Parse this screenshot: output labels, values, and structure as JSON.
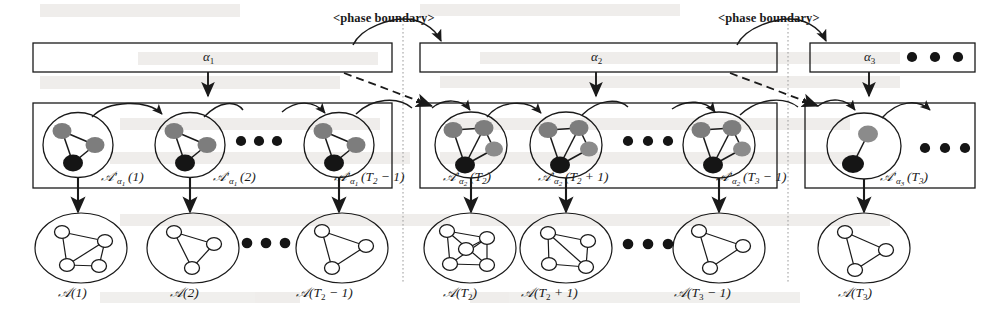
{
  "figure": {
    "type": "diagram",
    "background": "#ffffff",
    "ink": "#1a1a1a",
    "node_gray": "#7d7d7d",
    "node_black": "#151515",
    "node_hollow": "#ffffff",
    "dotted_guide_color": "#9a9a9a"
  },
  "annotations": {
    "phase_boundary_1": "<phase boundary>",
    "phase_boundary_2": "<phase boundary>"
  },
  "phase_row": {
    "boxes": [
      {
        "id": "alpha1",
        "label": "α",
        "sub": "1"
      },
      {
        "id": "alpha2",
        "label": "α",
        "sub": "2"
      },
      {
        "id": "alpha3",
        "label": "α",
        "sub": "3"
      }
    ],
    "trailing_ellipsis": "• • •"
  },
  "latent_row": {
    "label_prefix": "G′",
    "items": [
      {
        "id": "ga1-1",
        "alpha": "1",
        "arg": "(1)",
        "nodes": 3,
        "phase": "alpha1"
      },
      {
        "id": "ga1-2",
        "alpha": "1",
        "arg": "(2)",
        "nodes": 3,
        "phase": "alpha1"
      },
      {
        "id": "ga1-T2m1",
        "alpha": "1",
        "arg": "(T2 − 1)",
        "nodes": 3,
        "phase": "alpha1"
      },
      {
        "id": "ga2-T2",
        "alpha": "2",
        "arg": "(T2)",
        "nodes": 4,
        "phase": "alpha2"
      },
      {
        "id": "ga2-T2p1",
        "alpha": "2",
        "arg": "(T2 + 1)",
        "nodes": 4,
        "phase": "alpha2"
      },
      {
        "id": "ga2-T3m1",
        "alpha": "2",
        "arg": "(T3 − 1)",
        "nodes": 4,
        "phase": "alpha2"
      },
      {
        "id": "ga3-T3",
        "alpha": "3",
        "arg": "(T3)",
        "nodes": 2,
        "phase": "alpha3"
      }
    ],
    "ellipsis": "• • •",
    "trailing_ellipsis": "• • •"
  },
  "observed_row": {
    "label_prefix": "G",
    "items": [
      {
        "id": "g-1",
        "arg": "(1)"
      },
      {
        "id": "g-2",
        "arg": "(2)"
      },
      {
        "id": "g-T2m1",
        "arg": "(T2 − 1)"
      },
      {
        "id": "g-T2",
        "arg": "(T2)"
      },
      {
        "id": "g-T2p1",
        "arg": "(T2 + 1)"
      },
      {
        "id": "g-T3m1",
        "arg": "(T3 − 1)"
      },
      {
        "id": "g-T3",
        "arg": "(T3)"
      }
    ],
    "ellipsis": "• • •"
  }
}
